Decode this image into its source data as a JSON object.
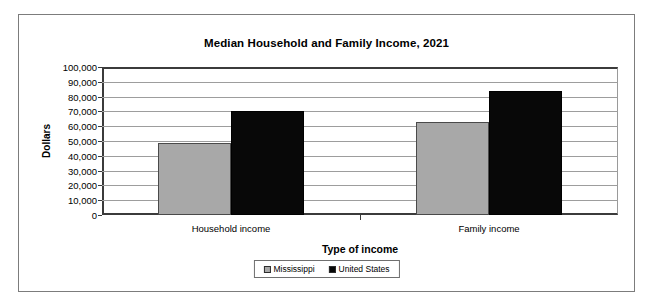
{
  "chart_data": {
    "type": "bar",
    "title": "Median Household and Family Income, 2021",
    "xlabel": "Type of income",
    "ylabel": "Dollars",
    "categories": [
      "Household income",
      "Family income"
    ],
    "series": [
      {
        "name": "Mississippi",
        "color": "#a8a8a8",
        "values": [
          48600,
          62700
        ]
      },
      {
        "name": "United States",
        "color": "#080808",
        "values": [
          70200,
          83700
        ]
      }
    ],
    "ylim": [
      0,
      100000
    ],
    "ytick_values": [
      0,
      10000,
      20000,
      30000,
      40000,
      50000,
      60000,
      70000,
      80000,
      90000,
      100000
    ],
    "ytick_labels": [
      "0",
      "10,000",
      "20,000",
      "30,000",
      "40,000",
      "50,000",
      "60,000",
      "70,000",
      "80,000",
      "90,000",
      "100,000"
    ],
    "grid": true,
    "legend_position": "bottom"
  }
}
